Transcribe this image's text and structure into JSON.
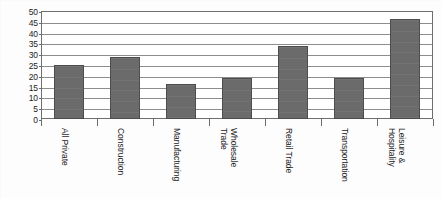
{
  "chart_data": {
    "type": "bar",
    "title": "",
    "subtitle": "",
    "xlabel": "",
    "ylabel": "",
    "categories": [
      "All Private",
      "Construction",
      "Manufacturing",
      "Wholesale Trade",
      "Retail Trade",
      "Transportation",
      "Leisure & Hospitality"
    ],
    "category_lines": [
      [
        "All Private"
      ],
      [
        "Construction"
      ],
      [
        "Manufacturing"
      ],
      [
        "Wholesale",
        "Trade"
      ],
      [
        "Retail Trade"
      ],
      [
        "Transportation"
      ],
      [
        "Leisure &",
        "Hospitality"
      ]
    ],
    "values": [
      25,
      28.5,
      16,
      19,
      34,
      19,
      46.5
    ],
    "ylim": [
      0,
      50
    ],
    "ytick_step": 5,
    "yticks": [
      50,
      45,
      40,
      35,
      30,
      25,
      20,
      15,
      10,
      5,
      0
    ],
    "ytick_labels": [
      "50",
      "45",
      "40",
      "35",
      "30",
      "25",
      "20",
      "15",
      "10",
      "5",
      "0"
    ],
    "grid": true,
    "legend": "none",
    "orientation": "vertical",
    "series": [
      {
        "name": "",
        "values": [
          25,
          28.5,
          16,
          19,
          34,
          19,
          46.5
        ]
      }
    ]
  },
  "style": {
    "bar_fill": "#6b6b6b",
    "bar_border": "#4c4c4c",
    "gridline_color": "#8d8d8d",
    "axis_color": "#6e6e6e",
    "background": "#ffffff",
    "text_color": "#242424"
  }
}
